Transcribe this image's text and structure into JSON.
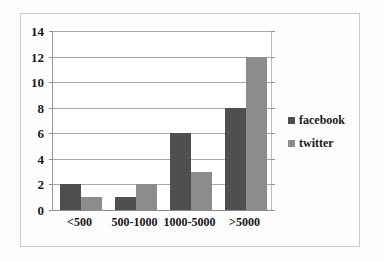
{
  "chart_data": {
    "type": "bar",
    "title": "",
    "subtitle": "",
    "xlabel": "",
    "ylabel": "",
    "categories": [
      "<500",
      "500-1000",
      "1000-5000",
      ">5000"
    ],
    "series": [
      {
        "name": "facebook",
        "color": "#4f4f4f",
        "values": [
          2,
          1,
          6,
          8
        ]
      },
      {
        "name": "twitter",
        "color": "#8c8c8c",
        "values": [
          1,
          2,
          3,
          12
        ]
      }
    ],
    "ylim": [
      0,
      14
    ],
    "yticks": [
      0,
      2,
      4,
      6,
      8,
      10,
      12,
      14
    ],
    "ytick_labels": [
      "0",
      "2",
      "4",
      "6",
      "8",
      "10",
      "12",
      "14"
    ],
    "grid": true,
    "grid_axis": "y",
    "legend_position": "right"
  }
}
